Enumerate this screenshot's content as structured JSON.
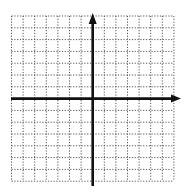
{
  "diagram": {
    "type": "coordinate-plane",
    "grid": {
      "columns": 14,
      "rows": 14,
      "left": 11.5,
      "top": 16,
      "cell_width": 11.6,
      "cell_height": 11.8,
      "line_style": "dotted",
      "line_color": "#555555"
    },
    "axes": {
      "color": "#111111",
      "width": 2.6,
      "x_axis": {
        "y": 98.6,
        "x_start": 11,
        "x_end": 181,
        "arrow": "right"
      },
      "y_axis": {
        "x": 92.7,
        "y_start": 13,
        "y_end": 186,
        "arrow": "up"
      }
    },
    "labels": []
  }
}
